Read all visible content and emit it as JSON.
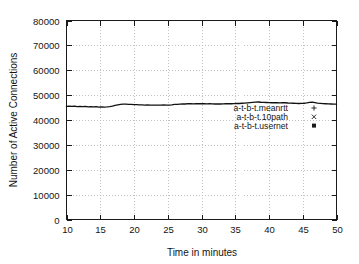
{
  "chart_data": {
    "type": "line",
    "title": "",
    "xlabel": "Time in minutes",
    "ylabel": "Number of Active Connections",
    "xlim": [
      10,
      50
    ],
    "ylim": [
      0,
      80000
    ],
    "grid": true,
    "legend_position": "center-right-inside",
    "x_ticks": [
      10,
      15,
      20,
      25,
      30,
      35,
      40,
      45,
      50
    ],
    "x_tick_labels": [
      "10",
      "15",
      "20",
      "25",
      "30",
      "35",
      "40",
      "45",
      "50"
    ],
    "y_ticks": [
      0,
      10000,
      20000,
      30000,
      40000,
      50000,
      60000,
      70000,
      80000
    ],
    "y_tick_labels": [
      "0",
      "10000",
      "20000",
      "30000",
      "40000",
      "50000",
      "60000",
      "70000",
      "80000"
    ],
    "series": [
      {
        "name": "a-t-b-t.meanrtt",
        "marker": "+",
        "color": "#111111",
        "x": [
          10.0,
          10.4,
          10.8,
          11.2,
          11.6,
          12.0,
          12.4,
          12.8,
          13.2,
          13.6,
          14.0,
          14.4,
          14.8,
          15.2,
          15.6,
          16.0,
          16.4,
          16.8,
          17.2,
          17.6,
          18.0,
          18.4,
          18.8,
          19.2,
          19.6,
          20.0,
          20.4,
          20.8,
          21.2,
          21.6,
          22.0,
          22.4,
          22.8,
          23.2,
          23.6,
          24.0,
          24.4,
          24.8,
          25.2,
          25.6,
          26.0,
          26.4,
          26.8,
          27.2,
          27.6,
          28.0,
          28.4,
          28.8,
          29.2,
          29.6,
          30.0,
          30.4,
          30.8,
          31.2,
          31.6,
          32.0,
          32.4,
          32.8,
          33.2,
          33.6,
          34.0,
          34.4,
          34.8,
          35.2,
          35.6,
          36.0,
          36.4,
          36.8,
          37.2,
          37.6,
          38.0,
          38.4,
          38.8,
          39.2,
          39.6,
          40.0,
          40.4,
          40.8,
          41.2,
          41.6,
          42.0,
          42.4,
          42.8,
          43.2,
          43.6,
          44.0,
          44.4,
          44.8,
          45.2,
          45.6,
          46.0,
          46.4,
          46.8,
          47.2,
          47.6,
          48.0,
          48.4,
          48.8,
          49.2,
          49.6,
          50.0
        ],
        "y": [
          45500,
          45600,
          45450,
          45550,
          45400,
          45500,
          45350,
          45450,
          45300,
          45400,
          45250,
          45350,
          45200,
          45300,
          45150,
          45250,
          45400,
          45600,
          45900,
          46100,
          46300,
          46400,
          46350,
          46300,
          46250,
          46200,
          46150,
          46100,
          46050,
          46000,
          46050,
          46000,
          45950,
          46000,
          45950,
          46000,
          46050,
          46000,
          45950,
          46100,
          46300,
          46250,
          46400,
          46500,
          46450,
          46600,
          46550,
          46500,
          46600,
          46550,
          46600,
          46550,
          46500,
          46550,
          46500,
          46450,
          46500,
          46450,
          46500,
          46550,
          46600,
          46550,
          46600,
          46700,
          46650,
          46750,
          46800,
          46900,
          47000,
          47100,
          47200,
          47250,
          47150,
          47100,
          47050,
          47000,
          46950,
          47000,
          46950,
          46900,
          47000,
          46950,
          46850,
          46800,
          46750,
          46700,
          46650,
          46700,
          46750,
          46900,
          47100,
          47200,
          47000,
          46800,
          46700,
          46600,
          46550,
          46500,
          46450,
          46400,
          46350
        ]
      },
      {
        "name": "a-t-b-t.10path",
        "marker": "x",
        "color": "#111111",
        "x": [],
        "y": []
      },
      {
        "name": "a-t-b-t.usernet",
        "marker": "square",
        "color": "#111111",
        "x": [],
        "y": []
      }
    ]
  },
  "legend": {
    "entries": [
      {
        "label": "a-t-b-t.meanrtt",
        "marker": "+"
      },
      {
        "label": "a-t-b-t.10path",
        "marker": "x"
      },
      {
        "label": "a-t-b-t.usernet",
        "marker": "square"
      }
    ]
  },
  "colors": {
    "background": "#ffffff",
    "frame": "#1a1a1a",
    "grid": "#b6b6b6",
    "series": "#111111",
    "text": "#141414"
  }
}
